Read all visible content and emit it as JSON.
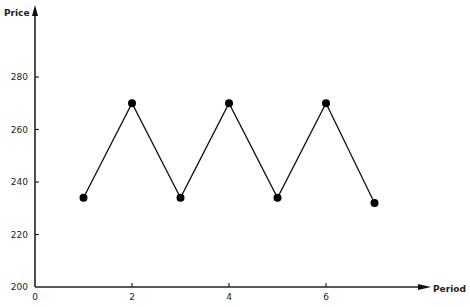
{
  "chart_data": {
    "type": "line",
    "title": "",
    "xlabel": "Period",
    "ylabel": "Price",
    "x": [
      1,
      2,
      3,
      4,
      5,
      6,
      7
    ],
    "series": [
      {
        "name": "Price",
        "values": [
          234,
          270,
          234,
          270,
          234,
          270,
          232
        ]
      }
    ],
    "xlim": [
      0,
      8
    ],
    "ylim": [
      200,
      290
    ],
    "x_ticks": [
      0,
      2,
      4,
      6
    ],
    "y_ticks": [
      200,
      220,
      240,
      260,
      280
    ],
    "grid": false,
    "legend": "none",
    "markers": "filled-circle",
    "line_color": "#111111"
  },
  "axes": {
    "x_label": "Period",
    "y_label": "Price",
    "x_tick_labels": [
      "0",
      "2",
      "4",
      "6"
    ],
    "y_tick_labels": [
      "200",
      "220",
      "240",
      "260",
      "280"
    ]
  }
}
